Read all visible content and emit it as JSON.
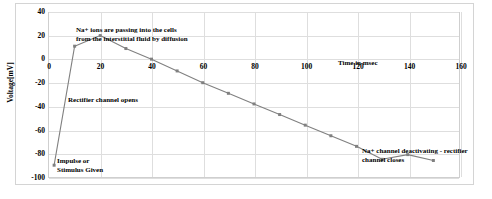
{
  "chart_data": {
    "type": "line",
    "title": "",
    "xlabel": "Time in msec",
    "ylabel": "Voltage[mV]",
    "xlim": [
      0,
      160
    ],
    "ylim": [
      -100,
      40
    ],
    "grid": true,
    "legend": "none",
    "x_ticks": [
      0,
      20,
      40,
      60,
      80,
      100,
      120,
      140,
      160
    ],
    "y_ticks": [
      40,
      20,
      0,
      -20,
      -40,
      -60,
      -80,
      -100
    ],
    "series": [
      {
        "name": "Membrane potential",
        "color": "#808080",
        "marker": "square",
        "x": [
          2,
          10,
          20,
          30,
          40,
          50,
          60,
          70,
          80,
          90,
          100,
          110,
          120,
          130,
          140,
          150
        ],
        "values": [
          -90,
          11,
          20,
          9,
          0,
          -10,
          -20,
          -29,
          -38,
          -47,
          -56,
          -65,
          -74,
          -85,
          -81,
          -86
        ]
      }
    ],
    "annotations": [
      {
        "id": "sodium-influx",
        "text_line1": "Na+ ions are passing into the cells",
        "text_line2": "from the interstitial fluid by diffusion"
      },
      {
        "id": "rectifier-opens",
        "text_line1": "Rectifier channel opens",
        "text_line2": ""
      },
      {
        "id": "impulse",
        "text_line1": "Impulse or",
        "text_line2": "Stimulus Given"
      },
      {
        "id": "time-axis",
        "text_line1": "Time in msec",
        "text_line2": ""
      },
      {
        "id": "deactivating",
        "text_line1": "Na+ channel deactivating  - rectifier",
        "text_line2": "channel closes"
      }
    ]
  },
  "caption": {
    "text": ""
  },
  "colors": {
    "series_line": "#808080",
    "grid": "#dedede",
    "axis": "#cfcfcf",
    "frame": "#d4d4d4",
    "text": "#000000",
    "background": "#ffffff"
  }
}
